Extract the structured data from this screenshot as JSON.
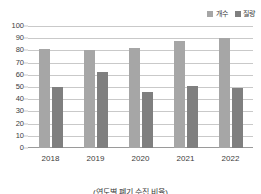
{
  "chart_data": {
    "type": "bar",
    "title": "",
    "subtitle": "",
    "xlabel": "",
    "ylabel": "",
    "categories": [
      "2018",
      "2019",
      "2020",
      "2021",
      "2022"
    ],
    "series": [
      {
        "name": "개수",
        "values": [
          81,
          80,
          82,
          88,
          90
        ],
        "color": "#a6a6a6"
      },
      {
        "name": "질량",
        "values": [
          50,
          62,
          46,
          51,
          49
        ],
        "color": "#7f7f7f"
      }
    ],
    "ylim": [
      0,
      100
    ],
    "ytick_step": 10,
    "yticks": [
      "100",
      "90",
      "80",
      "70",
      "60",
      "50",
      "40",
      "30",
      "20",
      "10",
      "0"
    ],
    "grid": true,
    "legend_position": "top-right",
    "caption": "(연도별 폐기 수집 비율)"
  },
  "legend": {
    "entries": [
      {
        "label": "개수",
        "swatch": "legend-swatch-count"
      },
      {
        "label": "질량",
        "swatch": "legend-swatch-mass"
      }
    ]
  },
  "colors": {
    "series_count": "#a6a6a6",
    "series_mass": "#7f7f7f",
    "gridline": "#c9c9c9",
    "axis": "#9a9a9a",
    "text": "#3a3a3a",
    "background": "#ffffff"
  }
}
